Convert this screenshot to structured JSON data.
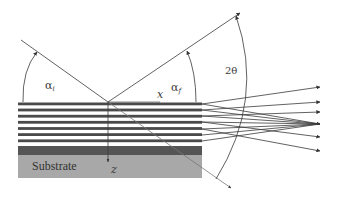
{
  "diagram": {
    "type": "x-ray scattering geometry on a multilayer",
    "labels": {
      "alpha_i": {
        "symbol": "α",
        "subscript": "i"
      },
      "alpha_f": {
        "symbol": "α",
        "subscript": "f"
      },
      "two_theta": "2θ",
      "x_axis": "x",
      "z_axis": "z",
      "substrate": "Substrate"
    },
    "colors": {
      "line": "#3a3a3a",
      "layer_dark": "#4a4a4a",
      "layer_light": "#ffffff",
      "buffer_band": "#555555",
      "substrate": "#a8a8a8"
    },
    "multilayer": {
      "stripe_count": 7,
      "stripe_y": [
        104,
        110,
        116,
        122,
        129,
        135,
        141
      ],
      "x_start": 18,
      "x_end": 202
    },
    "outgoing_arrow_y": [
      87,
      102,
      112,
      124,
      137,
      151
    ]
  }
}
